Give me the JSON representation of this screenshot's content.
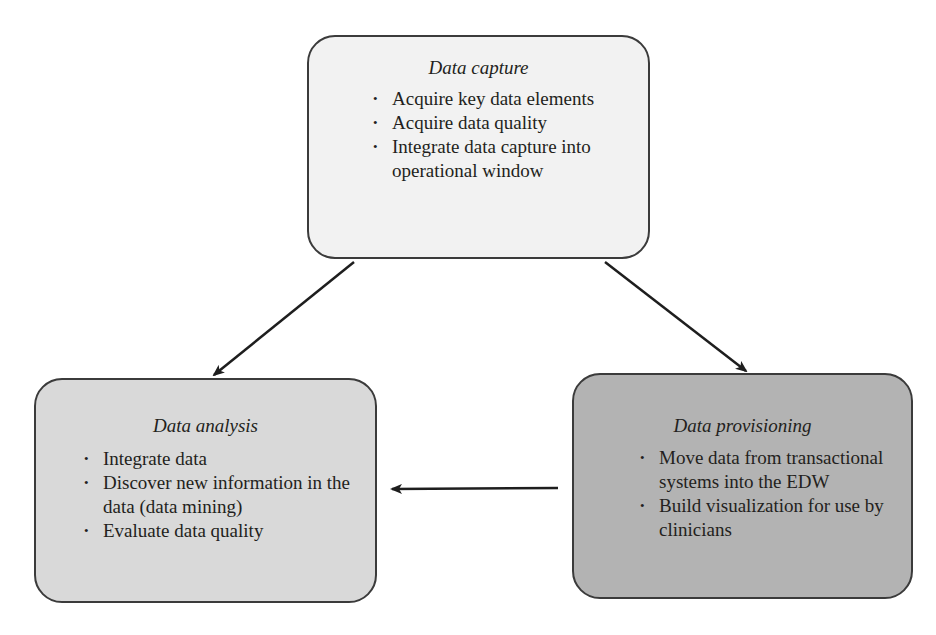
{
  "diagram": {
    "nodes": [
      {
        "id": "data-capture",
        "title": "Data capture",
        "fill": "#f2f2f2",
        "bullets": [
          "Acquire key data elements",
          "Acquire data quality",
          "Integrate data capture into operational window"
        ]
      },
      {
        "id": "data-analysis",
        "title": "Data analysis",
        "fill": "#d9d9d9",
        "bullets": [
          "Integrate data",
          "Discover new information in the data (data mining)",
          "Evaluate data quality"
        ]
      },
      {
        "id": "data-provisioning",
        "title": "Data provisioning",
        "fill": "#b3b3b3",
        "bullets": [
          "Move data from transactional systems into the EDW",
          "Build visualization for use by clinicians"
        ]
      }
    ],
    "edges": [
      {
        "from": "data-capture",
        "to": "data-analysis"
      },
      {
        "from": "data-capture",
        "to": "data-provisioning"
      },
      {
        "from": "data-provisioning",
        "to": "data-analysis"
      }
    ],
    "bullet_glyph": "•",
    "stroke_color": "#1e1e1e"
  }
}
